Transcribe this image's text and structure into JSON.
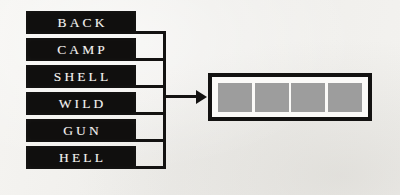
{
  "diagram": {
    "type": "word-to-slots-mapping",
    "background_color": "#f2f1ee",
    "labels": [
      {
        "text": "BACK"
      },
      {
        "text": "CAMP"
      },
      {
        "text": "SHELL"
      },
      {
        "text": "WILD"
      },
      {
        "text": "GUN"
      },
      {
        "text": "HELL"
      }
    ],
    "label_style": {
      "background_color": "#100f0e",
      "text_color": "#f4f3f0"
    },
    "connector": {
      "color": "#131211",
      "arrow_direction": "right"
    },
    "output": {
      "cell_count": 4,
      "cell_color": "#9d9d9d",
      "border_color": "#131211",
      "fill_color": "#fbfaf8",
      "cells": [
        {
          "label": ""
        },
        {
          "label": ""
        },
        {
          "label": ""
        },
        {
          "label": ""
        }
      ]
    }
  }
}
